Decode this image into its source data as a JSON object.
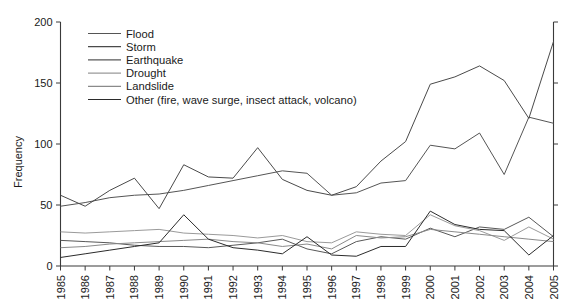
{
  "chart_data": {
    "type": "line",
    "title": "",
    "xlabel": "",
    "ylabel": "Frequency",
    "xlim": [
      1985,
      2005
    ],
    "ylim": [
      0,
      200
    ],
    "yticks": [
      0,
      50,
      100,
      150,
      200
    ],
    "grid": false,
    "legend_position": "top-left-inside",
    "x": [
      1985,
      1986,
      1987,
      1988,
      1989,
      1990,
      1991,
      1992,
      1993,
      1994,
      1995,
      1996,
      1997,
      1998,
      1999,
      2000,
      2001,
      2002,
      2003,
      2004,
      2005
    ],
    "categories": [
      "1985",
      "1986",
      "1987",
      "1988",
      "1989",
      "1990",
      "1991",
      "1992",
      "1993",
      "1994",
      "1995",
      "1996",
      "1997",
      "1998",
      "1999",
      "2000",
      "2001",
      "2002",
      "2003",
      "2004",
      "2005"
    ],
    "series": [
      {
        "name": "Flood",
        "color": "#555555",
        "values": [
          49,
          52,
          56,
          58,
          59,
          62,
          66,
          70,
          74,
          78,
          76,
          58,
          60,
          68,
          70,
          99,
          96,
          109,
          75,
          122,
          117
        ]
      },
      {
        "name": "Storm",
        "color": "#4a4a4a",
        "values": [
          58,
          49,
          62,
          72,
          47,
          83,
          73,
          72,
          97,
          71,
          62,
          58,
          65,
          86,
          102,
          149,
          155,
          164,
          152,
          121,
          184
        ]
      },
      {
        "name": "Earthquake",
        "color": "#585858",
        "values": [
          21,
          20,
          19,
          17,
          16,
          16,
          15,
          17,
          19,
          22,
          14,
          10,
          20,
          24,
          22,
          31,
          24,
          32,
          30,
          40,
          24
        ]
      },
      {
        "name": "Drought",
        "color": "#9a9a9a",
        "values": [
          28,
          27,
          28,
          29,
          30,
          27,
          26,
          25,
          23,
          25,
          20,
          19,
          28,
          26,
          25,
          42,
          33,
          29,
          21,
          32,
          22
        ]
      },
      {
        "name": "Landslide",
        "color": "#8a8a8a",
        "values": [
          15,
          16,
          18,
          19,
          20,
          21,
          22,
          20,
          19,
          16,
          18,
          14,
          25,
          23,
          24,
          30,
          28,
          26,
          24,
          22,
          20
        ]
      },
      {
        "name": "Other (fire, wave surge, insect attack, volcano)",
        "color": "#2b2b2b",
        "values": [
          7,
          10,
          13,
          16,
          19,
          42,
          22,
          15,
          13,
          10,
          24,
          9,
          8,
          16,
          16,
          45,
          34,
          30,
          29,
          9,
          25
        ]
      }
    ]
  },
  "legend": {
    "items": [
      {
        "label": "Flood"
      },
      {
        "label": "Storm"
      },
      {
        "label": "Earthquake"
      },
      {
        "label": "Drought"
      },
      {
        "label": "Landslide"
      },
      {
        "label": "Other (fire, wave surge, insect attack, volcano)"
      }
    ]
  },
  "axes": {
    "y_title": "Frequency",
    "y_tick_labels": [
      "0",
      "50",
      "100",
      "150",
      "200"
    ],
    "x_tick_labels": [
      "1985",
      "1986",
      "1987",
      "1988",
      "1989",
      "1990",
      "1991",
      "1992",
      "1993",
      "1994",
      "1995",
      "1996",
      "1997",
      "1998",
      "1999",
      "2000",
      "2001",
      "2002",
      "2003",
      "2004",
      "2005"
    ]
  }
}
